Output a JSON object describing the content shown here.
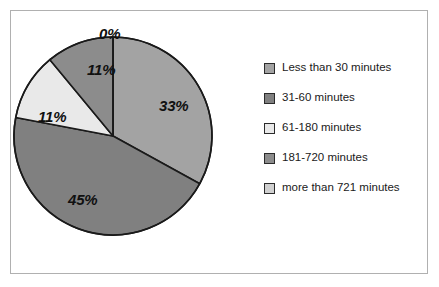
{
  "chart_data": {
    "type": "pie",
    "title": "",
    "categories": [
      "Less than 30 minutes",
      "31-60 minutes",
      "61-180 minutes",
      "181-720 minutes",
      "more than 721 minutes"
    ],
    "values": [
      33,
      45,
      11,
      11,
      0
    ],
    "value_labels": [
      "33%",
      "45%",
      "11%",
      "11%",
      "0%"
    ],
    "colors": [
      "#a3a3a3",
      "#808080",
      "#e9e9e9",
      "#8c8c8c",
      "#d0d0d0"
    ],
    "legend_position": "right",
    "start_angle_deg": 0,
    "direction": "clockwise",
    "grid": false,
    "slices": [
      {
        "label": "Less than 30 minutes",
        "value": 33,
        "display": "33%",
        "color": "#a3a3a3"
      },
      {
        "label": "31-60 minutes",
        "value": 45,
        "display": "45%",
        "color": "#808080"
      },
      {
        "label": "61-180 minutes",
        "value": 11,
        "display": "11%",
        "color": "#e9e9e9"
      },
      {
        "label": "181-720 minutes",
        "value": 11,
        "display": "11%",
        "color": "#8c8c8c"
      },
      {
        "label": "more than 721 minutes",
        "value": 0,
        "display": "0%",
        "color": "#d0d0d0"
      }
    ]
  },
  "legend": {
    "items": [
      {
        "label": "Less than 30 minutes",
        "color": "#a3a3a3"
      },
      {
        "label": "31-60 minutes",
        "color": "#808080"
      },
      {
        "label": "61-180 minutes",
        "color": "#e9e9e9"
      },
      {
        "label": "181-720 minutes",
        "color": "#8c8c8c"
      },
      {
        "label": "more than 721 minutes",
        "color": "#d0d0d0"
      }
    ]
  },
  "labels": {
    "zero": "0%",
    "thirty_three": "33%",
    "forty_five": "45%",
    "eleven_left": "11%",
    "eleven_top": "11%"
  }
}
